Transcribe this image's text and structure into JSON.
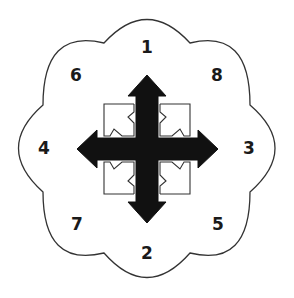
{
  "diagram": {
    "title": "",
    "center": [
      147,
      150
    ],
    "colors": {
      "outline": "#333333",
      "arrow_fill": "#111111",
      "background": "#ffffff",
      "text": "#1a1a1a"
    },
    "outline_shape": "eight-lobed cloud",
    "central_symbol": "four-way move arrow (up, down, left, right)",
    "corner_markers": "four outlined notched squares pointing diagonally outward",
    "labels": [
      {
        "id": "1",
        "text": "1",
        "position": "top",
        "x": 147,
        "y": 47
      },
      {
        "id": "8",
        "text": "8",
        "position": "top-right",
        "x": 217,
        "y": 75
      },
      {
        "id": "3",
        "text": "3",
        "position": "right",
        "x": 249,
        "y": 148
      },
      {
        "id": "5",
        "text": "5",
        "position": "bottom-right",
        "x": 218,
        "y": 224
      },
      {
        "id": "2",
        "text": "2",
        "position": "bottom",
        "x": 147,
        "y": 253
      },
      {
        "id": "7",
        "text": "7",
        "position": "bottom-left",
        "x": 77,
        "y": 224
      },
      {
        "id": "4",
        "text": "4",
        "position": "left",
        "x": 44,
        "y": 148
      },
      {
        "id": "6",
        "text": "6",
        "position": "top-left",
        "x": 76,
        "y": 75
      }
    ]
  }
}
